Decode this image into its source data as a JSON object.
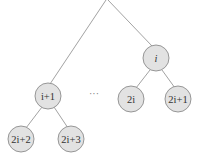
{
  "diagram": {
    "type": "binary-tree (heap indexing)",
    "nodes": [
      {
        "id": "i",
        "label": "i",
        "italic_parts": [
          "i"
        ]
      },
      {
        "id": "i1",
        "label": "i+1"
      },
      {
        "id": "2i",
        "label": "2i"
      },
      {
        "id": "2i1",
        "label": "2i+1"
      },
      {
        "id": "2i2",
        "label": "2i+2"
      },
      {
        "id": "2i3",
        "label": "2i+3"
      }
    ],
    "edges": [
      [
        "root",
        "i1"
      ],
      [
        "root",
        "i"
      ],
      [
        "i",
        "2i"
      ],
      [
        "i",
        "2i1"
      ],
      [
        "i1",
        "2i2"
      ],
      [
        "i1",
        "2i3"
      ]
    ],
    "ellipsis": "···"
  }
}
